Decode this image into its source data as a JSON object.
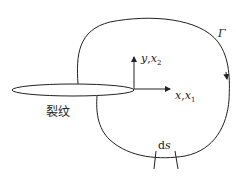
{
  "diagram": {
    "title": "",
    "labels": {
      "crack": "裂纹",
      "contour": "Γ",
      "y_axis_var": "y",
      "y_axis_alt": "x",
      "y_axis_sub": "2",
      "x_axis_var": "x",
      "x_axis_alt": "x",
      "x_axis_sub": "1",
      "separator": ",",
      "ds": "ds"
    },
    "colors": {
      "stroke": "#222222",
      "background": "#ffffff"
    }
  }
}
